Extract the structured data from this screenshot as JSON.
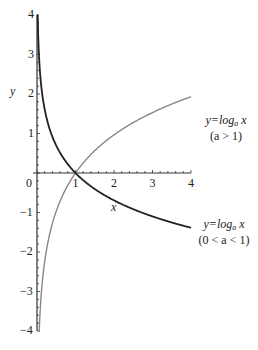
{
  "chart_data": {
    "type": "line",
    "title": "",
    "xlabel": "x",
    "ylabel": "y",
    "xlim": [
      0,
      4
    ],
    "ylim": [
      -4,
      4
    ],
    "x_ticks": [
      "0",
      "1",
      "2",
      "3",
      "4"
    ],
    "y_ticks": [
      "4",
      "3",
      "2",
      "1",
      "-1",
      "-2",
      "-3",
      "-4"
    ],
    "grid": false,
    "series": [
      {
        "name": "y=log_a x (a > 1)",
        "function": "log_2(x)",
        "color": "#888888",
        "points": [
          [
            0.06,
            -4
          ],
          [
            0.25,
            -2
          ],
          [
            0.5,
            -1
          ],
          [
            1,
            0
          ],
          [
            2,
            1
          ],
          [
            4,
            2
          ]
        ]
      },
      {
        "name": "y=log_a x (0 < a < 1)",
        "function": "log_(1/e)(x)",
        "color": "#222222",
        "points": [
          [
            0.02,
            4
          ],
          [
            0.05,
            3
          ],
          [
            0.14,
            2
          ],
          [
            0.37,
            1
          ],
          [
            1,
            0
          ],
          [
            2,
            -0.69
          ],
          [
            4,
            -1.39
          ]
        ]
      }
    ],
    "annotations": [
      {
        "line1_prefix": "y=log",
        "sub": "a",
        "line1_suffix": " x",
        "line2": "(a > 1)"
      },
      {
        "line1_prefix": "y=log",
        "sub": "a",
        "line1_suffix": " x",
        "line2": "(0 < a < 1)"
      }
    ]
  },
  "axis": {
    "x_label": "x",
    "y_label": "y",
    "x_tick_labels": [
      "0",
      "1",
      "2",
      "3",
      "4"
    ],
    "y_tick_labels": [
      "4",
      "3",
      "2",
      "1",
      "−1",
      "−2",
      "−3",
      "−4"
    ]
  },
  "labels": {
    "upper": {
      "prefix": "y=log",
      "sub": "a",
      "suffix": " x",
      "cond": "(a > 1)"
    },
    "lower": {
      "prefix": "y=log",
      "sub": "a",
      "suffix": " x",
      "cond": "(0 < a < 1)"
    }
  }
}
